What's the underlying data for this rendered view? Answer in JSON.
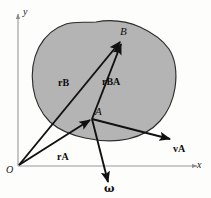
{
  "figure": {
    "type": "kinematics-vector-diagram",
    "caption_absent": true,
    "background_color": "#fdfdfc",
    "body_fill_color": "#b3b3b3",
    "body_outline_color": "#2b2b2b",
    "axis_color": "#8c8c8c",
    "vector_color": "#111111"
  },
  "axes": {
    "x_label": "x",
    "y_label": "y",
    "origin_label": "O"
  },
  "points": {
    "a_label": "A",
    "b_label": "B"
  },
  "vectors": [
    {
      "name": "r-a",
      "symbol": "r",
      "subscript": "A",
      "description": "position vector from origin O to point A"
    },
    {
      "name": "r-b",
      "symbol": "r",
      "subscript": "B",
      "description": "position vector from origin O to point B"
    },
    {
      "name": "r-ba",
      "symbol": "r",
      "subscript": "BA",
      "description": "relative position vector from A to B"
    },
    {
      "name": "v-a",
      "symbol": "v",
      "subscript": "A",
      "description": "velocity vector at point A"
    },
    {
      "name": "omega",
      "symbol": "ω",
      "subscript": "",
      "description": "angular velocity vector of the rigid body"
    }
  ],
  "labels": {
    "r_a": "r",
    "r_a_sub": "A",
    "r_b": "r",
    "r_b_sub": "B",
    "r_ba": "r",
    "r_ba_sub": "BA",
    "v_a": "v",
    "v_a_sub": "A",
    "omega": "ω"
  }
}
